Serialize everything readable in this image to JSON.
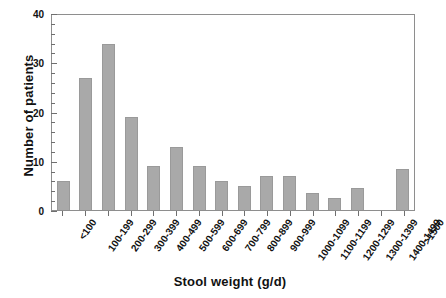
{
  "chart_data": {
    "type": "bar",
    "title": "",
    "xlabel": "Stool weight (g/d)",
    "ylabel": "Number of patients",
    "categories": [
      "<100",
      "100-199",
      "200-299",
      "300-399",
      "400-499",
      "500-599",
      "600-699",
      "700-799",
      "800-899",
      "900-999",
      "1000-1099",
      "1100-1199",
      "1200-1299",
      "1300-1399",
      "1400-1499",
      ">1500"
    ],
    "values": [
      6,
      27,
      34,
      19,
      9,
      13,
      9,
      6,
      5,
      7,
      7,
      3.5,
      2.5,
      4.5,
      0,
      8.5
    ],
    "ylim": [
      0,
      40
    ],
    "yticks": [
      0,
      10,
      20,
      30,
      40
    ],
    "ytick_labels": [
      "0",
      "10",
      "20",
      "30",
      "40"
    ],
    "y_minor_interval": 2,
    "grid": false,
    "legend": "none",
    "bar_color": "#a9a9a9",
    "bar_border_color": "#9a9a9a",
    "axis_color": "#8e8e8e"
  }
}
